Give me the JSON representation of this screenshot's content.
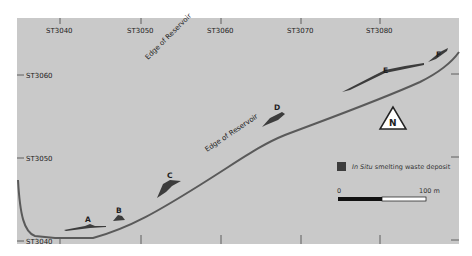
{
  "map": {
    "background_color": "#c9c9c9",
    "feature_color": "#3c3c3c",
    "x_grid_labels": [
      "ST3040",
      "ST3050",
      "ST3060",
      "ST3070",
      "ST3080"
    ],
    "y_grid_labels": [
      "ST3060",
      "ST3050",
      "ST3040"
    ],
    "annotations": {
      "edge_upper": "Edge of Reservoir",
      "edge_lower": "Edge of Reservoir"
    },
    "sites": [
      "A",
      "B",
      "C",
      "D",
      "E",
      "F"
    ],
    "north_label": "N"
  },
  "legend": {
    "italic_part": "In Situ",
    "text": " smelting waste deposit"
  },
  "scale_bar": {
    "start_label": "0",
    "end_label": "100 m"
  }
}
